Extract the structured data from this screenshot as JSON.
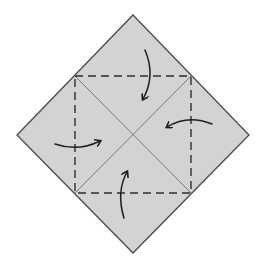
{
  "title": "Origami fold diagram: fold four corners to the center",
  "colors": {
    "background": "#ffffff",
    "paper_fill": "#d3d3d3",
    "outline": "#4a4a4a",
    "crease": "#7a7a7a",
    "dashed": "#2e2e2e",
    "arrow": "#1e1e1e"
  },
  "square": {
    "vertices": {
      "top": [
        133,
        15
      ],
      "right": [
        249,
        135
      ],
      "bottom": [
        133,
        253
      ],
      "left": [
        17,
        135
      ]
    }
  },
  "valley_fold_square": {
    "corners": {
      "tl": [
        75,
        76
      ],
      "tr": [
        191,
        76
      ],
      "br": [
        191,
        193
      ],
      "bl": [
        75,
        193
      ]
    },
    "dash": "8 5"
  },
  "creases": [
    {
      "from": [
        75,
        76
      ],
      "to": [
        191,
        193
      ]
    },
    {
      "from": [
        191,
        76
      ],
      "to": [
        75,
        193
      ]
    }
  ],
  "arrows": [
    {
      "name": "top-corner-fold-arrow",
      "path": "M145 50 Q156 76 143 99",
      "direction": "down"
    },
    {
      "name": "right-corner-fold-arrow",
      "path": "M212 124 Q188 114 167 127",
      "direction": "left"
    },
    {
      "name": "bottom-corner-fold-arrow",
      "path": "M124 218 Q116 192 127 172",
      "direction": "up"
    },
    {
      "name": "left-corner-fold-arrow",
      "path": "M55 144 Q78 152 100 141",
      "direction": "right"
    }
  ]
}
